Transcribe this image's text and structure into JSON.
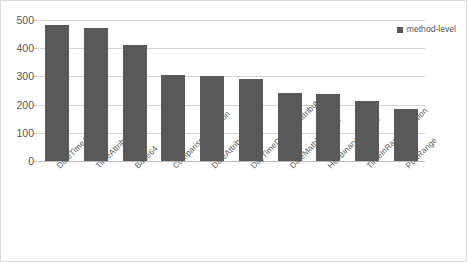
{
  "chart_data": {
    "type": "bar",
    "title": "",
    "xlabel": "",
    "ylabel": "",
    "ylim": [
      0,
      500
    ],
    "yticks": [
      0,
      100,
      200,
      300,
      400,
      500
    ],
    "grid": true,
    "legend_position": "top-right",
    "series": [
      {
        "name": "method-level",
        "color": "#595959",
        "values": [
          484,
          471,
          411,
          306,
          300,
          290,
          240,
          236,
          213,
          185
        ]
      }
    ],
    "categories": [
      "DateTimeAttribute",
      "TimeAttribute",
      "Base64",
      "ComparisonFunction",
      "DateAttribute",
      "DayTimeDurationAttribute",
      "DateMathFunction",
      "HexBinaryAttribute",
      "TimeInRangeFunction",
      "PortRange"
    ]
  },
  "legend": {
    "swatch_name": "legend-color-swatch",
    "label": "method-level"
  },
  "axis": {
    "y_tick_labels": [
      "500",
      "400",
      "300",
      "200",
      "100",
      "0"
    ]
  }
}
